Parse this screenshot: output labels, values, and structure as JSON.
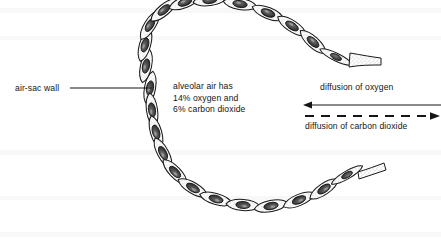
{
  "diagram": {
    "background_color": "#ffffff",
    "ink_color": "#1a1a1a"
  },
  "labels": {
    "air_sac_wall": "air-sac wall",
    "alveolar_air_line1": "alveolar air has",
    "alveolar_air_line2": "14% oxygen and",
    "alveolar_air_line3": "6% carbon dioxide",
    "diffusion_oxygen": "diffusion of oxygen",
    "diffusion_carbon_dioxide": "diffusion of carbon dioxide"
  },
  "values": {
    "oxygen_percent": "14%",
    "carbon_dioxide_percent": "6%"
  },
  "arrows": [
    {
      "name": "oxygen-arrow",
      "label": "diffusion of oxygen",
      "style": "solid",
      "direction": "left",
      "x1": 441,
      "y1": 105,
      "x2": 304,
      "y2": 105
    },
    {
      "name": "carbon-dioxide-arrow",
      "label": "diffusion of carbon dioxide",
      "style": "dashed",
      "direction": "right",
      "x1": 304,
      "y1": 116,
      "x2": 441,
      "y2": 116
    }
  ],
  "leader_lines": [
    {
      "name": "air-sac-wall-leader",
      "from_x": 70,
      "from_y": 88,
      "to_x": 152,
      "to_y": 88
    }
  ],
  "alveolar_wall": {
    "shape": "open C-ring of flattened epithelial cells",
    "opening_side": "right",
    "cell_count": 22,
    "cell_description": "spindle-shaped cell with dark oval nucleus and stippled cytoplasm"
  }
}
